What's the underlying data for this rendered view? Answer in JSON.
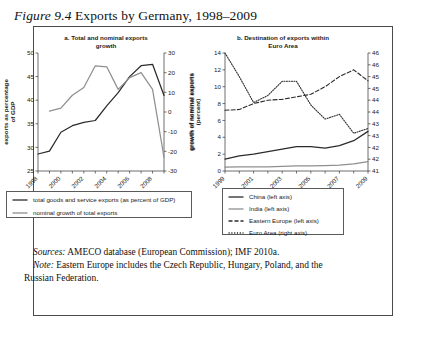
{
  "figure": {
    "label": "Figure 9.4",
    "title": "Exports by Germany, 1998–2009"
  },
  "panel_a": {
    "title_line1": "a. Total and nominal exports",
    "title_line2": "growth"
  },
  "panel_b": {
    "title_line1": "b. Destination of exports within",
    "title_line2": "Euro Area"
  },
  "legend_a": {
    "items": [
      {
        "label": "total goods and service exports (as percent of GDP)",
        "color": "#2b2b2b",
        "style": "solid"
      },
      {
        "label": "nominal growth of total exports",
        "color": "#8f8f8f",
        "style": "solid"
      }
    ]
  },
  "legend_b": {
    "items": [
      {
        "label": "China (left axis)",
        "color": "#2b2b2b",
        "style": "solid"
      },
      {
        "label": "India (left axis)",
        "color": "#8f8f8f",
        "style": "solid"
      },
      {
        "label": "Eastern Europe (left axis)",
        "color": "#2b2b2b",
        "style": "dashed"
      },
      {
        "label": "Euro Area (right axis)",
        "color": "#2b2b2b",
        "style": "dotted"
      }
    ]
  },
  "notes": {
    "sources_label": "Sources:",
    "sources_text": " AMECO database (European Commission); IMF 2010a.",
    "note_label": "Note:",
    "note_text": " Eastern Europe includes the Czech Republic, Hungary, Poland, and the Russian Federation."
  },
  "chart_data": [
    {
      "type": "line",
      "panel": "a",
      "title": "a. Total and nominal exports growth",
      "xlabel": "",
      "ylabel": "exports as percentage of GDP",
      "y2label": "growth of nominal exports",
      "xlim": [
        1998,
        2009
      ],
      "ylim": [
        25,
        50
      ],
      "y2lim": [
        -30,
        30
      ],
      "yticks": [
        25,
        30,
        35,
        40,
        45,
        50
      ],
      "y2ticks": [
        -30,
        -20,
        -10,
        0,
        10,
        20,
        30
      ],
      "xticks": [
        1998,
        2000,
        2002,
        2004,
        2006,
        2008
      ],
      "xtick_labels": [
        "1998",
        "2000",
        "2002",
        "2004",
        "2006",
        "2008"
      ],
      "x": [
        1998,
        1999,
        2000,
        2001,
        2002,
        2003,
        2004,
        2005,
        2006,
        2007,
        2008,
        2009
      ],
      "grid": false,
      "legend_position": "below",
      "series": [
        {
          "name": "total goods and service exports (as percent of GDP)",
          "axis": "left",
          "color": "#2b2b2b",
          "style": "solid",
          "values": [
            28.6,
            29.2,
            33.2,
            34.6,
            35.3,
            35.7,
            38.8,
            41.6,
            45.0,
            47.3,
            47.6,
            41.0
          ]
        },
        {
          "name": "nominal growth of total exports",
          "axis": "right",
          "color": "#8f8f8f",
          "style": "solid",
          "values": [
            null,
            0.5,
            2.0,
            8.5,
            12.5,
            23.5,
            23.0,
            11.5,
            17.5,
            20.0,
            11.5,
            -23.0
          ]
        }
      ]
    },
    {
      "type": "line",
      "panel": "b",
      "title": "b. Destination of exports within Euro Area",
      "xlabel": "",
      "ylabel": "growth of nominal exports (percent)",
      "y2label": "",
      "xlim": [
        1999,
        2009
      ],
      "ylim": [
        0,
        14
      ],
      "y2lim": [
        41,
        46
      ],
      "yticks": [
        0,
        2,
        4,
        6,
        8,
        10,
        12,
        14
      ],
      "y2ticks": [
        41,
        41.5,
        42,
        42.5,
        43,
        43.5,
        44,
        44.5,
        45,
        45.5,
        46
      ],
      "y2tick_labels": [
        "41",
        "42",
        "42",
        "43",
        "43",
        "44",
        "44",
        "45",
        "45",
        "46",
        "46"
      ],
      "xticks": [
        1999,
        2001,
        2003,
        2005,
        2007,
        2009
      ],
      "xtick_labels": [
        "1999",
        "2001",
        "2003",
        "2005",
        "2007",
        "2009"
      ],
      "x": [
        1999,
        2000,
        2001,
        2002,
        2003,
        2004,
        2005,
        2006,
        2007,
        2008,
        2009
      ],
      "grid": false,
      "legend_position": "below",
      "series": [
        {
          "name": "China (left axis)",
          "axis": "left",
          "color": "#2b2b2b",
          "style": "solid",
          "values": [
            1.4,
            1.8,
            2.0,
            2.3,
            2.6,
            2.9,
            2.9,
            2.7,
            3.0,
            3.6,
            4.7
          ]
        },
        {
          "name": "India (left axis)",
          "axis": "left",
          "color": "#8f8f8f",
          "style": "solid",
          "values": [
            0.45,
            0.5,
            0.5,
            0.5,
            0.55,
            0.6,
            0.6,
            0.65,
            0.7,
            0.85,
            1.1
          ]
        },
        {
          "name": "Eastern Europe (left axis)",
          "axis": "left",
          "color": "#2b2b2b",
          "style": "dashed",
          "values": [
            7.2,
            7.3,
            8.0,
            8.4,
            8.5,
            8.8,
            9.1,
            10.0,
            11.2,
            12.0,
            10.7
          ]
        },
        {
          "name": "Euro Area (right axis)",
          "axis": "right",
          "color": "#2b2b2b",
          "style": "dotted",
          "values": [
            46.0,
            45.0,
            43.9,
            44.2,
            44.8,
            44.8,
            43.8,
            43.2,
            43.4,
            42.6,
            42.8
          ]
        }
      ]
    }
  ]
}
